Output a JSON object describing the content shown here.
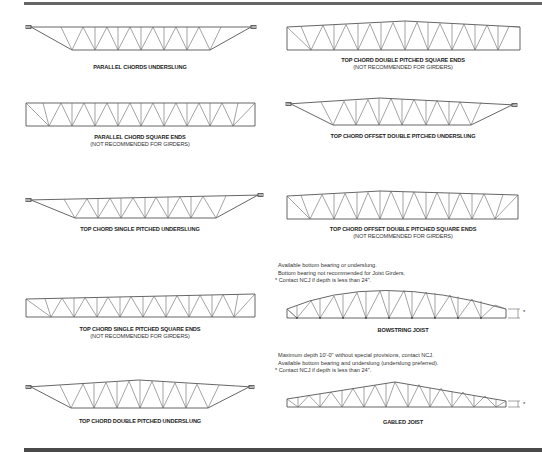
{
  "diagrams": [
    {
      "id": "parallel-chords-underslung",
      "title": "PARALLEL CHORDS UNDERSLUNG",
      "subtitle": ""
    },
    {
      "id": "top-chord-double-pitched-square-ends",
      "title": "TOP CHORD DOUBLE PITCHED SQUARE ENDS",
      "subtitle": "(NOT RECOMMENDED FOR GIRDERS)"
    },
    {
      "id": "parallel-chord-square-ends",
      "title": "PARALLEL CHORD SQUARE ENDS",
      "subtitle": "(NOT RECOMMENDED FOR GIRDERS)"
    },
    {
      "id": "top-chord-offset-double-pitched-underslung",
      "title": "TOP CHORD OFFSET DOUBLE PITCHED UNDERSLUNG",
      "subtitle": ""
    },
    {
      "id": "top-chord-single-pitched-underslung",
      "title": "TOP CHORD SINGLE PITCHED UNDERSLUNG",
      "subtitle": ""
    },
    {
      "id": "top-chord-offset-double-pitched-square-ends",
      "title": "TOP CHORD OFFSET DOUBLE PITCHED SQUARE ENDS",
      "subtitle": "(NOT RECOMMENDED FOR GIRDERS)"
    },
    {
      "id": "top-chord-single-pitched-square-ends",
      "title": "TOP CHORD SINGLE PITCHED SQUARE ENDS",
      "subtitle": "(NOT RECOMMENDED FOR GIRDERS)"
    },
    {
      "id": "bowstring-joist",
      "title": "BOWSTRING JOIST",
      "subtitle": ""
    },
    {
      "id": "top-chord-double-pitched-underslung",
      "title": "TOP CHORD DOUBLE PITCHED UNDERSLUNG",
      "subtitle": ""
    },
    {
      "id": "gabled-joist",
      "title": "GABLED JOIST",
      "subtitle": ""
    }
  ],
  "notes": {
    "bowstring": [
      "Available bottom bearing or underslung.",
      "Bottom bearing not recommended for Joist Girders.",
      "* Contact NCJ if depth is less than 24\"."
    ],
    "gabled": [
      "Maximum depth 10'-0\" without special provisions, contact NCJ.",
      "Available bottom bearing and underslung (underslung preferred).",
      "* Contact NCJ if depth is less than 24\"."
    ]
  },
  "depth_marker": "*"
}
